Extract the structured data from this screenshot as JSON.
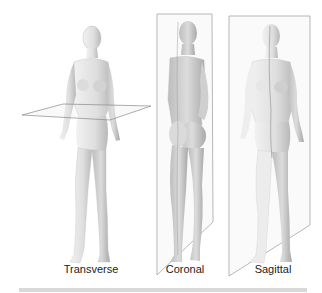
{
  "figure": {
    "panels": [
      {
        "id": "transverse",
        "label": "Transverse",
        "view": "front-left"
      },
      {
        "id": "coronal",
        "label": "Coronal",
        "view": "back-side"
      },
      {
        "id": "sagittal",
        "label": "Sagittal",
        "view": "front"
      }
    ]
  },
  "colors": {
    "background": "#ffffff",
    "skin": "#e6e6e6",
    "shade": "#b5b5b5",
    "plane_line": "#8a8a8a",
    "bottom_bar": "#d9d9d9",
    "text": "#222222"
  }
}
